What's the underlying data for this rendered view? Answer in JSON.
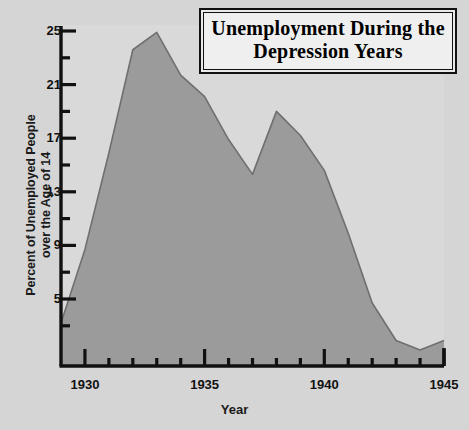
{
  "title": "Unemployment During\nthe Depression Years",
  "axes": {
    "xlabel": "Year",
    "ylabel": "Percent of Unemployed People\nover the Age of 14",
    "y_ticks_major": [
      "5",
      "9",
      "13",
      "17",
      "21",
      "25"
    ],
    "x_ticks_major": [
      "1930",
      "1935",
      "1940",
      "1945"
    ]
  },
  "colors": {
    "page_background": "#d5d5d5",
    "plot_background": "#d9d9d9",
    "area_fill": "#9b9b9b",
    "area_line": "#6f6f6f",
    "axis": "#111111",
    "title_box_fill": "#efefef",
    "title_box_border": "#111111"
  },
  "chart_data": {
    "type": "area",
    "title": "Unemployment During the Depression Years",
    "xlabel": "Year",
    "ylabel": "Percent of Unemployed People over the Age of 14",
    "xlim": [
      1929,
      1945
    ],
    "ylim": [
      0,
      25
    ],
    "yticks_major": [
      5,
      9,
      13,
      17,
      21,
      25
    ],
    "yticks_minor": [
      3,
      7,
      11,
      15,
      19,
      23
    ],
    "xticks_major": [
      1930,
      1935,
      1940,
      1945
    ],
    "xticks_minor": [
      1931,
      1932,
      1933,
      1934,
      1936,
      1937,
      1938,
      1939,
      1941,
      1942,
      1943,
      1944
    ],
    "grid": false,
    "legend": null,
    "x": [
      1929,
      1930,
      1931,
      1932,
      1933,
      1934,
      1935,
      1936,
      1937,
      1938,
      1939,
      1940,
      1941,
      1942,
      1943,
      1944,
      1945
    ],
    "values": [
      3.2,
      8.7,
      15.9,
      23.6,
      24.9,
      21.7,
      20.1,
      16.9,
      14.3,
      19.0,
      17.2,
      14.6,
      9.9,
      4.7,
      1.9,
      1.2,
      1.9
    ],
    "series": [
      {
        "name": "Percent unemployed (over age 14)",
        "values": [
          3.2,
          8.7,
          15.9,
          23.6,
          24.9,
          21.7,
          20.1,
          16.9,
          14.3,
          19.0,
          17.2,
          14.6,
          9.9,
          4.7,
          1.9,
          1.2,
          1.9
        ]
      }
    ],
    "annotations": {
      "peak_year": 1933,
      "peak_value": 24.9,
      "local_min_year": 1937,
      "local_min_value": 14.3,
      "secondary_peak_year": 1938,
      "secondary_peak_value": 19.0
    }
  }
}
